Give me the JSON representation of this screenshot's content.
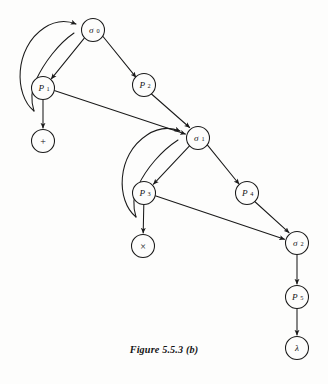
{
  "figure": {
    "caption": "Figure 5.5.3 (b)",
    "background_color": "#fdfdfc",
    "ink_color": "#1a1a1a",
    "width": 328,
    "height": 384
  },
  "diagram": {
    "type": "directed-graph",
    "node_radius": 11.5,
    "nodes": [
      {
        "id": "sigma0",
        "label": "σ",
        "sub": "0",
        "kind": "state",
        "cx": 93,
        "cy": 30
      },
      {
        "id": "P1",
        "label": "P",
        "sub": "1",
        "kind": "production",
        "cx": 43,
        "cy": 88
      },
      {
        "id": "P2",
        "label": "P",
        "sub": "2",
        "kind": "production",
        "cx": 144,
        "cy": 85
      },
      {
        "id": "plus",
        "label": "+",
        "sub": "",
        "kind": "terminal",
        "cx": 43,
        "cy": 141
      },
      {
        "id": "sigma1",
        "label": "σ",
        "sub": "1",
        "kind": "state",
        "cx": 198,
        "cy": 138
      },
      {
        "id": "P3",
        "label": "P",
        "sub": "3",
        "kind": "production",
        "cx": 144,
        "cy": 193
      },
      {
        "id": "P4",
        "label": "P",
        "sub": "4",
        "kind": "production",
        "cx": 247,
        "cy": 193
      },
      {
        "id": "times",
        "label": "×",
        "sub": "",
        "kind": "terminal",
        "cx": 143,
        "cy": 246
      },
      {
        "id": "sigma2",
        "label": "σ",
        "sub": "2",
        "kind": "state",
        "cx": 297,
        "cy": 243
      },
      {
        "id": "P5",
        "label": "P",
        "sub": "5",
        "kind": "production",
        "cx": 297,
        "cy": 297
      },
      {
        "id": "lambda",
        "label": "λ",
        "sub": "",
        "kind": "terminal",
        "cx": 297,
        "cy": 348
      }
    ],
    "edges": [
      {
        "id": "e-sigma0-P1",
        "from": "sigma0",
        "to": "P1",
        "style": "straight"
      },
      {
        "id": "e-sigma0-P2",
        "from": "sigma0",
        "to": "P2",
        "style": "straight"
      },
      {
        "id": "e-P1-plus",
        "from": "P1",
        "to": "plus",
        "style": "straight"
      },
      {
        "id": "e-P1-sigma1",
        "from": "P1",
        "to": "sigma1",
        "style": "straight"
      },
      {
        "id": "e-P2-sigma1",
        "from": "P2",
        "to": "sigma1",
        "style": "straight"
      },
      {
        "id": "e-P1-sigma0-arc",
        "from": "P1",
        "to": "sigma0",
        "style": "crescent-feedback"
      },
      {
        "id": "e-sigma1-P3",
        "from": "sigma1",
        "to": "P3",
        "style": "straight"
      },
      {
        "id": "e-sigma1-P4",
        "from": "sigma1",
        "to": "P4",
        "style": "straight"
      },
      {
        "id": "e-P3-times",
        "from": "P3",
        "to": "times",
        "style": "straight"
      },
      {
        "id": "e-P3-sigma2",
        "from": "P3",
        "to": "sigma2",
        "style": "straight"
      },
      {
        "id": "e-P4-sigma2",
        "from": "P4",
        "to": "sigma2",
        "style": "straight"
      },
      {
        "id": "e-P3-sigma1-arc",
        "from": "P3",
        "to": "sigma1",
        "style": "crescent-feedback"
      },
      {
        "id": "e-sigma2-P5",
        "from": "sigma2",
        "to": "P5",
        "style": "straight"
      },
      {
        "id": "e-P5-lambda",
        "from": "P5",
        "to": "lambda",
        "style": "straight"
      }
    ]
  }
}
